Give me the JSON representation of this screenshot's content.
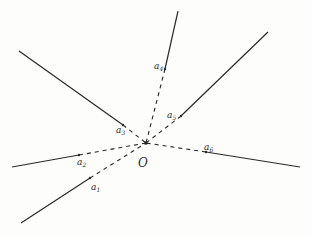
{
  "diagram": {
    "origin": {
      "label": "O",
      "x": 146,
      "y": 143
    },
    "rays": [
      {
        "id": "a1",
        "base": "a",
        "sub": "1",
        "end": [
          21,
          223
        ],
        "point": [
          90,
          178
        ],
        "label_pos": [
          91,
          190
        ]
      },
      {
        "id": "a2",
        "base": "a",
        "sub": "2",
        "end": [
          12,
          167
        ],
        "point": [
          79,
          155
        ],
        "label_pos": [
          77,
          165
        ]
      },
      {
        "id": "a3",
        "base": "a",
        "sub": "3",
        "end": [
          19,
          51
        ],
        "point": [
          123,
          125
        ],
        "label_pos": [
          116,
          133
        ]
      },
      {
        "id": "a4",
        "base": "a",
        "sub": "4",
        "end": [
          178,
          11
        ],
        "point": [
          165,
          69
        ],
        "label_pos": [
          154,
          69
        ]
      },
      {
        "id": "a5",
        "base": "a",
        "sub": "5",
        "end": [
          268,
          32
        ],
        "point": [
          181,
          116
        ],
        "label_pos": [
          167,
          118
        ]
      },
      {
        "id": "a6",
        "base": "a",
        "sub": "6",
        "end": [
          300,
          167
        ],
        "point": [
          206,
          152
        ],
        "label_pos": [
          204,
          150
        ]
      }
    ]
  }
}
